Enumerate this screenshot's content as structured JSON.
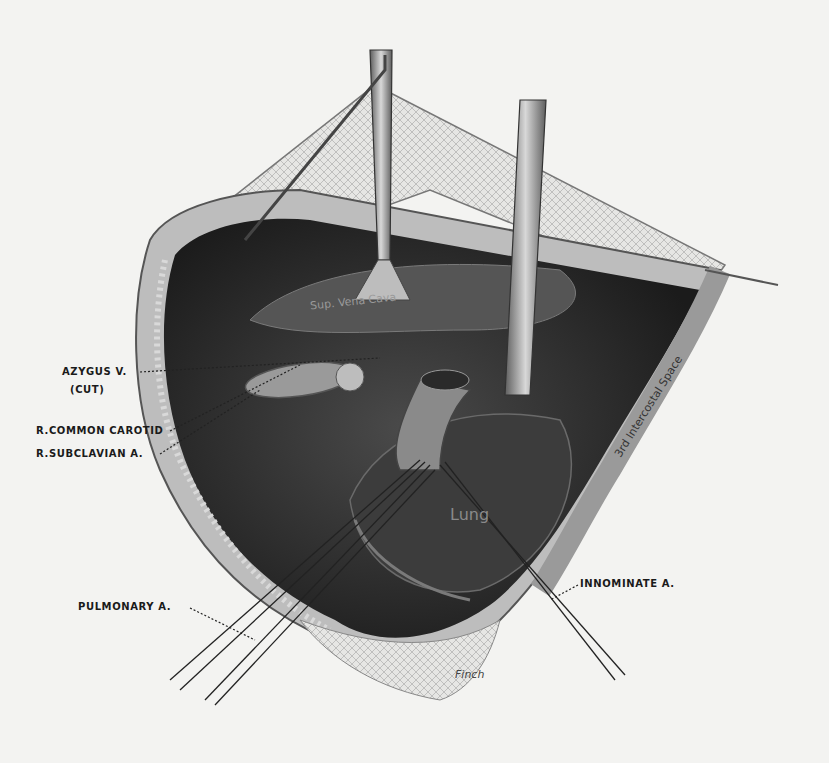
{
  "figure": {
    "type": "anatomical surgical illustration",
    "palette": {
      "paper": "#f3f3f1",
      "cavity": "#2b2b2b",
      "tissue": "#5a5a5a",
      "instrument": "#8c8c8c",
      "ink": "#1a1a1a"
    }
  },
  "labels": {
    "azygus": "AZYGUS V.",
    "azygus_note": "(CUT)",
    "common_carotid": "R.COMMON CAROTID",
    "subclavian": "R.SUBCLAVIAN A.",
    "pulmonary": "PULMONARY A.",
    "innominate": "INNOMINATE A.",
    "vena_cava": "Sup. Vena Cava",
    "intercostal": "3rd Intercostal Space",
    "lung": "Lung",
    "signature": "Finch"
  }
}
